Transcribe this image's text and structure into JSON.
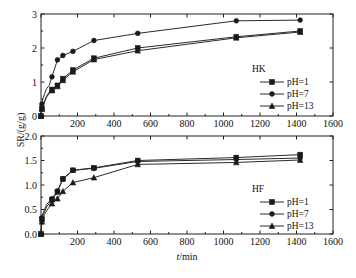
{
  "figure": {
    "background": "#ffffff",
    "axis_color": "#222222",
    "series_color": "#2b2b2b"
  },
  "shared": {
    "ylabel": "SR/(g/g)",
    "xlabel_italic": "t",
    "xlabel_rest": "/min"
  },
  "chart_data": [
    {
      "type": "line",
      "id": "hk",
      "title": "",
      "panel_label": "HK",
      "xlabel": "t/min",
      "ylabel": "SR/(g/g)",
      "xlim": [
        0,
        1600
      ],
      "ylim": [
        0,
        3
      ],
      "xticks": [
        0,
        200,
        400,
        600,
        800,
        1000,
        1200,
        1400,
        1600
      ],
      "xticklabels": [
        "",
        "200",
        "400",
        "600",
        "800",
        "1000",
        "1200",
        "1400",
        "1600"
      ],
      "yticks": [
        0,
        1,
        2,
        3
      ],
      "yticklabels": [
        "0",
        "1",
        "2",
        "3"
      ],
      "grid": false,
      "legend_position": "right-inside",
      "series": [
        {
          "name": "pH=1",
          "marker": "square",
          "x": [
            0,
            5,
            10,
            20,
            30,
            45,
            60,
            90,
            120,
            175,
            290,
            530,
            1070,
            1420
          ],
          "y": [
            0.0,
            0.22,
            0.3,
            0.45,
            0.58,
            0.7,
            0.78,
            0.9,
            1.1,
            1.35,
            1.7,
            2.0,
            2.33,
            2.5
          ]
        },
        {
          "name": "pH=7",
          "marker": "circle",
          "x": [
            0,
            5,
            10,
            20,
            30,
            45,
            60,
            90,
            120,
            175,
            290,
            530,
            1070,
            1420
          ],
          "y": [
            0.0,
            0.35,
            0.5,
            0.66,
            0.8,
            0.9,
            1.15,
            1.65,
            1.78,
            1.9,
            2.22,
            2.43,
            2.8,
            2.82
          ]
        },
        {
          "name": "pH=13",
          "marker": "triangle",
          "x": [
            0,
            5,
            10,
            20,
            30,
            45,
            60,
            90,
            120,
            175,
            290,
            530,
            1070,
            1420
          ],
          "y": [
            0.0,
            0.2,
            0.28,
            0.42,
            0.55,
            0.67,
            0.75,
            0.87,
            1.05,
            1.3,
            1.66,
            1.92,
            2.3,
            2.47
          ]
        }
      ]
    },
    {
      "type": "line",
      "id": "hf",
      "title": "",
      "panel_label": "HF",
      "xlabel": "t/min",
      "ylabel": "SR/(g/g)",
      "xlim": [
        0,
        1600
      ],
      "ylim": [
        0.0,
        2.0
      ],
      "xticks": [
        0,
        200,
        400,
        600,
        800,
        1000,
        1200,
        1400,
        1600
      ],
      "xticklabels": [
        "",
        "200",
        "400",
        "600",
        "800",
        "1000",
        "1200",
        "1400",
        "1600"
      ],
      "yticks": [
        0.0,
        0.5,
        1.0,
        1.5,
        2.0
      ],
      "yticklabels": [
        "0.0",
        "0.5",
        "1.0",
        "1.5",
        "2.0"
      ],
      "grid": false,
      "legend_position": "right-inside",
      "series": [
        {
          "name": "pH=1",
          "marker": "square",
          "x": [
            0,
            5,
            10,
            20,
            30,
            45,
            60,
            90,
            120,
            175,
            290,
            530,
            1070,
            1420
          ],
          "y": [
            0.0,
            0.3,
            0.38,
            0.46,
            0.55,
            0.62,
            0.7,
            0.86,
            1.12,
            1.3,
            1.35,
            1.5,
            1.56,
            1.62
          ]
        },
        {
          "name": "pH=7",
          "marker": "circle",
          "x": [
            0,
            5,
            10,
            20,
            30,
            45,
            60,
            90,
            120,
            175,
            290,
            530,
            1070,
            1420
          ],
          "y": [
            0.0,
            0.33,
            0.42,
            0.5,
            0.6,
            0.66,
            0.72,
            0.88,
            1.13,
            1.3,
            1.34,
            1.48,
            1.52,
            1.55
          ]
        },
        {
          "name": "pH=13",
          "marker": "triangle",
          "x": [
            0,
            5,
            10,
            20,
            30,
            45,
            60,
            90,
            120,
            175,
            290,
            530,
            1070,
            1420
          ],
          "y": [
            0.0,
            0.25,
            0.32,
            0.4,
            0.47,
            0.55,
            0.62,
            0.72,
            0.87,
            1.05,
            1.15,
            1.42,
            1.46,
            1.51
          ]
        }
      ]
    }
  ]
}
